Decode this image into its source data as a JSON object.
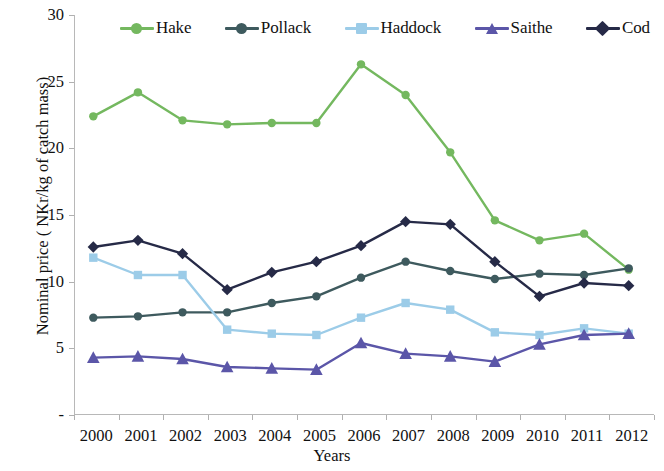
{
  "chart_data": {
    "type": "line",
    "title": "",
    "xlabel": "Years",
    "ylabel": "Nominal price ( NKr/kg of catch mass)",
    "categories": [
      "2000",
      "2001",
      "2002",
      "2003",
      "2004",
      "2005",
      "2006",
      "2007",
      "2008",
      "2009",
      "2010",
      "2011",
      "2012"
    ],
    "x": [
      2000,
      2001,
      2002,
      2003,
      2004,
      2005,
      2006,
      2007,
      2008,
      2009,
      2010,
      2011,
      2012
    ],
    "ylim": [
      0,
      30
    ],
    "yticks": [
      "-",
      "5",
      "10",
      "15",
      "20",
      "25",
      "30"
    ],
    "ytick_values": [
      0,
      5,
      10,
      15,
      20,
      25,
      30
    ],
    "grid": false,
    "legend_position": "top",
    "series": [
      {
        "name": "Hake",
        "color": "#74B85F",
        "marker": "circle",
        "values": [
          22.4,
          24.2,
          22.1,
          21.8,
          21.9,
          21.9,
          26.3,
          24.0,
          19.7,
          14.6,
          13.1,
          13.6,
          10.9
        ]
      },
      {
        "name": "Pollack",
        "color": "#3E5A5E",
        "marker": "circle",
        "values": [
          7.3,
          7.4,
          7.7,
          7.7,
          8.4,
          8.9,
          10.3,
          11.5,
          10.8,
          10.2,
          10.6,
          10.5,
          11.0
        ]
      },
      {
        "name": "Haddock",
        "color": "#9CCCE8",
        "marker": "square",
        "values": [
          11.8,
          10.5,
          10.5,
          6.4,
          6.1,
          6.0,
          7.3,
          8.4,
          7.9,
          6.2,
          6.0,
          6.5,
          6.1
        ]
      },
      {
        "name": "Saithe",
        "color": "#5B56A8",
        "marker": "triangle",
        "values": [
          4.3,
          4.4,
          4.2,
          3.6,
          3.5,
          3.4,
          5.4,
          4.6,
          4.4,
          4.0,
          5.3,
          6.0,
          6.1
        ]
      },
      {
        "name": "Cod",
        "color": "#262A47",
        "marker": "diamond",
        "values": [
          12.6,
          13.1,
          12.1,
          9.4,
          10.7,
          11.5,
          12.7,
          14.5,
          14.3,
          11.5,
          8.9,
          9.9,
          9.7
        ]
      }
    ]
  },
  "legend": {
    "items": [
      {
        "label": "Hake"
      },
      {
        "label": "Pollack"
      },
      {
        "label": "Haddock"
      },
      {
        "label": "Saithe"
      },
      {
        "label": "Cod"
      }
    ]
  },
  "axes": {
    "y_title": "Nominal price ( NKr/kg of catch mass)",
    "x_title": "Years"
  }
}
